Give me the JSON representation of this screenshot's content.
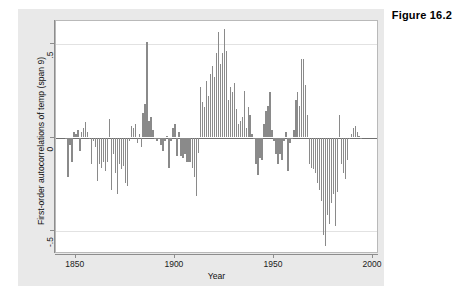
{
  "figure": {
    "label": "Figure 16.2"
  },
  "chart_data": {
    "type": "bar",
    "title": "",
    "xlabel": "Year",
    "ylabel": "First-order autocorrelations of temp (span 9)",
    "xlim": [
      1840,
      2003
    ],
    "ylim": [
      -0.62,
      0.62
    ],
    "grid": true,
    "legend": null,
    "bar_color": "#8a8a8a",
    "zero_line_color": "#6f6f6f",
    "xticks": [
      1850,
      1900,
      1950,
      2000
    ],
    "xtick_labels": [
      "1850",
      "1900",
      "1950",
      "2000"
    ],
    "yticks": [
      0.5,
      0,
      -0.5
    ],
    "ytick_labels": [
      ".5",
      "0",
      "-.5"
    ],
    "x": [
      1845,
      1846,
      1847,
      1848,
      1849,
      1850,
      1851,
      1852,
      1853,
      1854,
      1855,
      1856,
      1857,
      1858,
      1859,
      1860,
      1861,
      1862,
      1863,
      1864,
      1865,
      1866,
      1867,
      1868,
      1869,
      1870,
      1871,
      1872,
      1873,
      1874,
      1875,
      1876,
      1877,
      1878,
      1879,
      1880,
      1881,
      1882,
      1883,
      1884,
      1885,
      1886,
      1887,
      1888,
      1889,
      1890,
      1891,
      1892,
      1893,
      1894,
      1895,
      1896,
      1897,
      1898,
      1899,
      1900,
      1901,
      1902,
      1903,
      1904,
      1905,
      1906,
      1907,
      1908,
      1909,
      1910,
      1911,
      1912,
      1913,
      1914,
      1915,
      1916,
      1917,
      1918,
      1919,
      1920,
      1921,
      1922,
      1923,
      1924,
      1925,
      1926,
      1927,
      1928,
      1929,
      1930,
      1931,
      1932,
      1933,
      1934,
      1935,
      1936,
      1937,
      1938,
      1939,
      1940,
      1941,
      1942,
      1943,
      1944,
      1945,
      1946,
      1947,
      1948,
      1949,
      1950,
      1951,
      1952,
      1953,
      1954,
      1955,
      1956,
      1957,
      1958,
      1959,
      1960,
      1961,
      1962,
      1963,
      1964,
      1965,
      1966,
      1967,
      1968,
      1969,
      1970,
      1971,
      1972,
      1973,
      1974,
      1975,
      1976,
      1977,
      1978,
      1979,
      1980,
      1981,
      1982,
      1983,
      1984,
      1985,
      1986,
      1987,
      1988,
      1989,
      1990,
      1991,
      1992,
      1993,
      1994
    ],
    "values": [
      -0.01,
      -0.21,
      -0.04,
      -0.13,
      0.03,
      0.02,
      0.04,
      -0.07,
      0.03,
      0.05,
      0.08,
      0.03,
      -0.01,
      -0.14,
      -0.02,
      -0.05,
      -0.23,
      -0.14,
      -0.16,
      -0.13,
      -0.18,
      -0.13,
      0.1,
      -0.28,
      -0.09,
      -0.19,
      -0.3,
      -0.14,
      -0.17,
      -0.15,
      -0.24,
      -0.26,
      -0.02,
      0.06,
      0.05,
      0.07,
      -0.03,
      0.02,
      -0.05,
      0.13,
      0.18,
      0.51,
      0.09,
      0.11,
      0.04,
      0.0,
      -0.02,
      -0.01,
      -0.04,
      -0.07,
      -0.02,
      0.01,
      -0.16,
      -0.02,
      0.05,
      0.07,
      -0.1,
      0.03,
      -0.1,
      -0.11,
      -0.09,
      -0.13,
      -0.13,
      -0.13,
      -0.16,
      -0.21,
      -0.31,
      -0.08,
      0.27,
      0.19,
      0.16,
      0.3,
      0.22,
      0.34,
      0.38,
      0.32,
      0.45,
      0.56,
      0.39,
      0.45,
      0.58,
      0.46,
      0.2,
      0.27,
      0.24,
      0.29,
      0.15,
      0.07,
      0.09,
      0.11,
      0.25,
      0.05,
      0.16,
      0.12,
      0.02,
      -0.01,
      -0.14,
      -0.2,
      -0.11,
      -0.12,
      0.07,
      0.14,
      0.17,
      0.24,
      0.04,
      -0.02,
      -0.09,
      -0.14,
      -0.09,
      -0.12,
      -0.02,
      0.03,
      -0.18,
      -0.03,
      -0.01,
      0.04,
      0.2,
      0.24,
      0.17,
      0.42,
      0.42,
      0.28,
      0.12,
      -0.14,
      -0.16,
      -0.17,
      -0.19,
      -0.24,
      -0.28,
      -0.34,
      -0.52,
      -0.58,
      -0.41,
      -0.46,
      -0.35,
      -0.3,
      -0.47,
      -0.29,
      0.12,
      -0.14,
      -0.19,
      -0.22,
      -0.12,
      -0.01,
      0.02,
      0.05,
      0.06,
      0.03,
      0.01,
      -0.01
    ]
  }
}
